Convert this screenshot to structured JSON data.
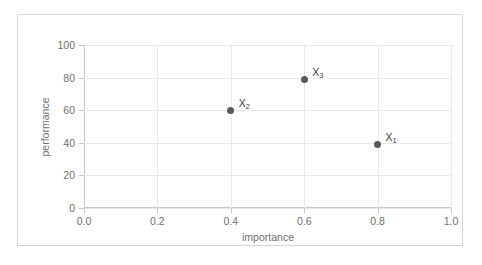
{
  "chart_data": {
    "type": "scatter",
    "title": "",
    "xlabel": "importance",
    "ylabel": "performance",
    "xlim": [
      0.0,
      1.0
    ],
    "ylim": [
      0,
      100
    ],
    "xticks": [
      "0.0",
      "0.2",
      "0.4",
      "0.6",
      "0.8",
      "1.0"
    ],
    "xtick_values": [
      0.0,
      0.2,
      0.4,
      0.6,
      0.8,
      1.0
    ],
    "yticks": [
      "0",
      "20",
      "40",
      "60",
      "80",
      "100"
    ],
    "ytick_values": [
      0,
      20,
      40,
      60,
      80,
      100
    ],
    "grid": true,
    "legend": "none",
    "points": [
      {
        "label": "X",
        "sub": "2",
        "x": 0.4,
        "y": 60
      },
      {
        "label": "X",
        "sub": "3",
        "x": 0.6,
        "y": 79
      },
      {
        "label": "X",
        "sub": "1",
        "x": 0.8,
        "y": 39
      }
    ],
    "marker_color": "#595959",
    "grid_color": "#e9e9e9",
    "axis_color": "#c8c8c8",
    "tick_label_color": "#6f6f6f",
    "frame_color": "#d4d4d4",
    "background": "#ffffff"
  }
}
